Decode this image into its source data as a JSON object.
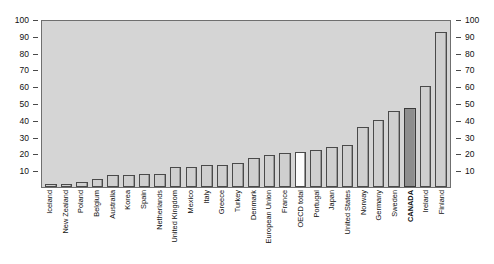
{
  "chart_data": {
    "type": "bar",
    "title": "",
    "xlabel": "",
    "ylabel": "",
    "ylim": [
      0,
      100
    ],
    "yticks": [
      10,
      20,
      30,
      40,
      50,
      60,
      70,
      80,
      90,
      100
    ],
    "grid": false,
    "legend": "none",
    "dual_axis": true,
    "categories": [
      "Iceland",
      "New Zealand",
      "Poland",
      "Belgium",
      "Australia",
      "Korea",
      "Spain",
      "Netherlands",
      "United Kingdom",
      "Mexico",
      "Italy",
      "Greece",
      "Turkey",
      "Denmark",
      "European Union",
      "France",
      "OECD total",
      "Portugal",
      "Japan",
      "United States",
      "Norway",
      "Germany",
      "Sweden",
      "CANADA",
      "Ireland",
      "Finland"
    ],
    "values": [
      2,
      2,
      3,
      5,
      7,
      7,
      8,
      8,
      12,
      12,
      13,
      13,
      14,
      17,
      19,
      20,
      21,
      22,
      24,
      25,
      36,
      40,
      45,
      47,
      60,
      92
    ],
    "styles": [
      "normal",
      "normal",
      "normal",
      "normal",
      "normal",
      "normal",
      "normal",
      "normal",
      "normal",
      "normal",
      "normal",
      "normal",
      "normal",
      "normal",
      "normal",
      "normal",
      "open",
      "normal",
      "normal",
      "normal",
      "normal",
      "normal",
      "normal",
      "highlight",
      "normal",
      "normal"
    ]
  },
  "colors": {
    "plot_background": "#d5d5d5",
    "bar_fill": "#cfcfcf",
    "bar_border": "#4a4a4a",
    "highlight_fill": "#8e8e8e",
    "open_fill": "#fdfdfd",
    "text": "#111111"
  }
}
